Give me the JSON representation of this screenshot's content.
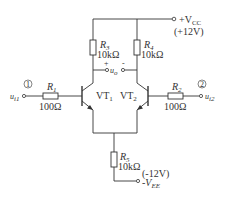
{
  "diagram": {
    "type": "circuit-schematic",
    "supply_positive": {
      "symbol": "+V",
      "subscript": "CC",
      "value": "(+12V)"
    },
    "supply_negative": {
      "symbol": "-V",
      "subscript": "EE",
      "value": "(-12V)"
    },
    "output": {
      "symbol": "u",
      "subscript": "o",
      "plus": "+",
      "minus": "-"
    },
    "inputs": [
      {
        "marker": "1",
        "symbol": "u",
        "subscript": "i1"
      },
      {
        "marker": "2",
        "symbol": "u",
        "subscript": "i2"
      }
    ],
    "resistors": [
      {
        "name": "R",
        "subscript": "1",
        "value": "100Ω"
      },
      {
        "name": "R",
        "subscript": "2",
        "value": "100Ω"
      },
      {
        "name": "R",
        "subscript": "3",
        "value": "10kΩ"
      },
      {
        "name": "R",
        "subscript": "4",
        "value": "10kΩ"
      },
      {
        "name": "R",
        "subscript": "5",
        "value": "10kΩ"
      }
    ],
    "transistors": [
      {
        "name": "VT",
        "subscript": "1"
      },
      {
        "name": "VT",
        "subscript": "2"
      }
    ]
  }
}
